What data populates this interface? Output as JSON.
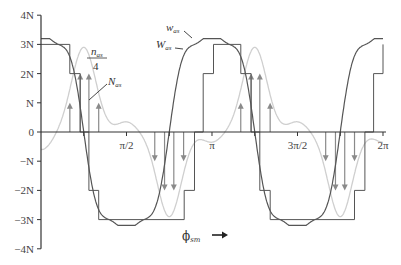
{
  "chart_data": {
    "type": "line",
    "title": "",
    "xlabel": "φ_sm",
    "ylabel": "",
    "xlim": [
      0,
      6.2832
    ],
    "ylim": [
      -4,
      4
    ],
    "grid": false,
    "x_ticks": [
      {
        "value": 0.0,
        "label": ""
      },
      {
        "value": 1.5708,
        "label": "π/2"
      },
      {
        "value": 3.1416,
        "label": "π"
      },
      {
        "value": 4.7124,
        "label": "3π/2"
      },
      {
        "value": 6.2832,
        "label": "2π"
      }
    ],
    "y_ticks": [
      {
        "value": 4,
        "label": "4N"
      },
      {
        "value": 3,
        "label": "3N"
      },
      {
        "value": 2,
        "label": "2N"
      },
      {
        "value": 1,
        "label": "N"
      },
      {
        "value": 0,
        "label": "0"
      },
      {
        "value": -1,
        "label": "−N"
      },
      {
        "value": -2,
        "label": "−2N"
      },
      {
        "value": -3,
        "label": "−3N"
      },
      {
        "value": -4,
        "label": "−4N"
      }
    ],
    "series": [
      {
        "name": "W_as",
        "description": "staircase winding function",
        "color": "#555555",
        "steps_x": [
          0.0,
          0.53,
          0.72,
          0.88,
          1.06,
          2.63,
          2.82,
          2.98,
          3.17,
          3.67,
          3.86,
          4.02,
          4.21,
          5.76,
          5.95,
          6.11,
          6.2832
        ],
        "steps_y": [
          3,
          2,
          0,
          -2,
          -3,
          -2,
          0,
          2,
          3,
          2,
          0,
          -2,
          -3,
          -2,
          0,
          2,
          3
        ]
      },
      {
        "name": "w_as",
        "description": "smoothed fundamental + harmonics of winding function",
        "color": "#555555",
        "amplitude_fundamental": 3.65,
        "harmonic_note": "ripples of about ±0.2N on 3N plateaus"
      },
      {
        "name": "n_as/4",
        "description": "quarter of turns distribution (light gray)",
        "color": "#c8c8c8",
        "peak": 2.9,
        "peak_x": [
          0.78,
          3.92
        ]
      },
      {
        "name": "N_as",
        "description": "conductor arrows (impulses)",
        "color": "#888888",
        "impulses": [
          {
            "x": 0.53,
            "y": 1
          },
          {
            "x": 0.72,
            "y": 2
          },
          {
            "x": 0.88,
            "y": 2
          },
          {
            "x": 1.06,
            "y": 1
          },
          {
            "x": 2.09,
            "y": -1
          },
          {
            "x": 2.27,
            "y": -2
          },
          {
            "x": 2.44,
            "y": -2
          },
          {
            "x": 2.62,
            "y": -1
          },
          {
            "x": 3.67,
            "y": 1
          },
          {
            "x": 3.86,
            "y": 2
          },
          {
            "x": 4.02,
            "y": 2
          },
          {
            "x": 4.21,
            "y": 1
          },
          {
            "x": 5.23,
            "y": -1
          },
          {
            "x": 5.41,
            "y": -2
          },
          {
            "x": 5.58,
            "y": -2
          },
          {
            "x": 5.76,
            "y": -1
          }
        ]
      }
    ],
    "annotations": [
      {
        "text": "n_as / 4",
        "x": 0.95,
        "y": 2.9
      },
      {
        "text": "N_as",
        "x": 1.05,
        "y": 1.8
      },
      {
        "text": "w_as",
        "x": 2.1,
        "y": 3.5
      },
      {
        "text": "W_as",
        "x": 2.1,
        "y": 3.0
      }
    ],
    "xlabel_arrow": "→"
  },
  "labels": {
    "n_num_base": "n",
    "n_num_sub": "as",
    "n_den": "4",
    "N_base": "N",
    "N_sub": "as",
    "w_base": "w",
    "w_sub": "as",
    "W_base": "W",
    "W_sub": "as",
    "phi": "ϕ",
    "phi_sub": "sm"
  }
}
